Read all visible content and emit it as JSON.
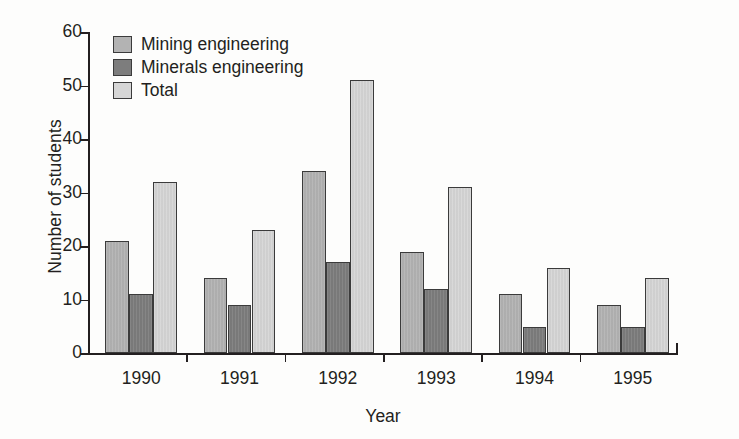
{
  "chart_data": {
    "type": "bar",
    "title": "",
    "xlabel": "Year",
    "ylabel": "Number of students",
    "categories": [
      "1990",
      "1991",
      "1992",
      "1993",
      "1994",
      "1995"
    ],
    "series": [
      {
        "name": "Mining engineering",
        "color": "#b3b3b3",
        "values": [
          21,
          14,
          34,
          19,
          11,
          9
        ]
      },
      {
        "name": "Minerals engineering",
        "color": "#7d7d7d",
        "values": [
          11,
          9,
          17,
          12,
          5,
          5
        ]
      },
      {
        "name": "Total",
        "color": "#d6d6d6",
        "values": [
          32,
          23,
          51,
          31,
          16,
          14
        ]
      }
    ],
    "ylim": [
      0,
      60
    ],
    "yticks": [
      0,
      10,
      20,
      30,
      40,
      50,
      60
    ],
    "ytick_labels": [
      "0",
      "10",
      "20",
      "30",
      "40",
      "50",
      "60"
    ],
    "grid": false,
    "legend_position": "top-left",
    "legend_entries": [
      "Mining engineering",
      "Minerals engineering",
      "Total"
    ]
  }
}
